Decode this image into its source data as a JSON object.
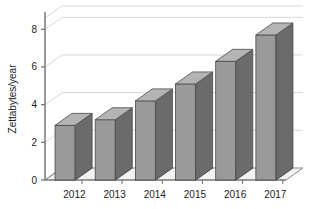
{
  "chart_data": {
    "type": "bar",
    "title": "",
    "subtitle": "",
    "xlabel": "",
    "ylabel": "Zettabytes/year",
    "categories": [
      "2012",
      "2013",
      "2014",
      "2015",
      "2016",
      "2017"
    ],
    "values": [
      2.9,
      3.2,
      4.2,
      5.1,
      6.3,
      7.7
    ],
    "series": [
      {
        "name": "Global IP traffic",
        "values": [
          2.9,
          3.2,
          4.2,
          5.1,
          6.3,
          7.7
        ]
      }
    ],
    "ylim": [
      0,
      8.6
    ],
    "xlim": [
      0,
      6
    ],
    "yticks": [
      0,
      2,
      4,
      6,
      8
    ],
    "ytick_labels": [
      "0",
      "2",
      "4",
      "6",
      "8"
    ],
    "grid": true,
    "grid_axis": "y",
    "legend": false,
    "legend_position": "none",
    "three_d": true,
    "annotations": [],
    "colors": {
      "background": "#ffffff",
      "bar_face": "#9a9a9a",
      "bar_side": "#6b6b6b",
      "bar_top": "#b4b4b4",
      "bar_outline": "#4a4a4a",
      "gridline": "#d8d8d8",
      "axis_line": "#6e6e6e",
      "floor": "#f2f2f2",
      "floor_line": "#8a8a8a",
      "text": "#1c1c1c"
    }
  }
}
